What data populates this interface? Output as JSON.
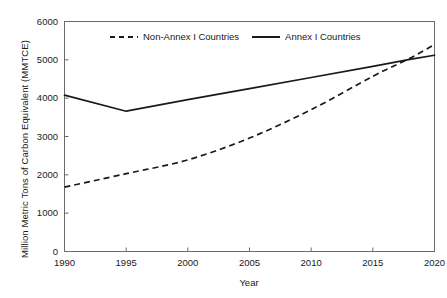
{
  "chart_data": {
    "type": "line",
    "title": "",
    "xlabel": "Year",
    "ylabel": "Million Metric Tons of Carbon Equivalent (MMTCE)",
    "xlim": [
      1990,
      2020
    ],
    "ylim": [
      0,
      6000
    ],
    "xticks": [
      1990,
      1995,
      2000,
      2005,
      2010,
      2015,
      2020
    ],
    "yticks": [
      0,
      1000,
      2000,
      3000,
      4000,
      5000,
      6000
    ],
    "xtick_labels": [
      "1990",
      "1995",
      "2000",
      "2005",
      "2010",
      "2015",
      "2020"
    ],
    "ytick_labels": [
      "0",
      "1000",
      "2000",
      "3000",
      "4000",
      "5000",
      "6000"
    ],
    "grid": false,
    "legend_position": "top-center-inside",
    "series": [
      {
        "name": "Non-Annex I Countries",
        "style": "dashed",
        "color": "#1a1a1a",
        "x": [
          1990,
          1995,
          2000,
          2005,
          2010,
          2015,
          2018,
          2020
        ],
        "values": [
          1680,
          2030,
          2390,
          2960,
          3700,
          4570,
          5040,
          5400
        ]
      },
      {
        "name": "Annex I Countries",
        "style": "solid",
        "color": "#1a1a1a",
        "x": [
          1990,
          1995,
          2000,
          2005,
          2010,
          2015,
          2018,
          2020
        ],
        "values": [
          4080,
          3660,
          3960,
          4250,
          4540,
          4830,
          5010,
          5120
        ]
      }
    ],
    "annotations": []
  },
  "legend": {
    "entries": [
      {
        "label": "Non-Annex I Countries",
        "style": "dashed"
      },
      {
        "label": "Annex I Countries",
        "style": "solid"
      }
    ]
  },
  "axes": {
    "x_title": "Year",
    "y_title": "Million Metric Tons of Carbon Equivalent (MMTCE)"
  },
  "colors": {
    "line": "#1a1a1a",
    "frame": "#6b6b6b",
    "background": "#ffffff"
  }
}
